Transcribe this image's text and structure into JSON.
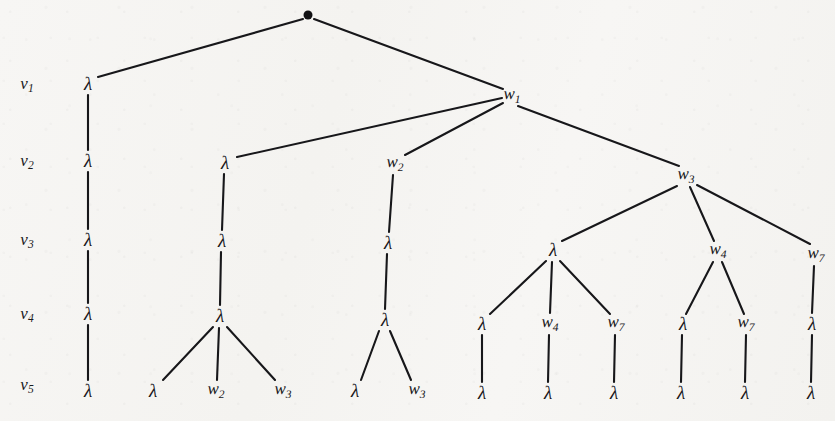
{
  "figure": {
    "kind": "labelled-tree-diagram",
    "width": 835,
    "height": 421,
    "background_color": "#f6f5f3",
    "ink_color": "#17171a"
  },
  "row_labels": [
    {
      "id": "row-v1",
      "text": "v",
      "sub": "1",
      "x": 27,
      "y": 84
    },
    {
      "id": "row-v2",
      "text": "v",
      "sub": "2",
      "x": 27,
      "y": 161
    },
    {
      "id": "row-v3",
      "text": "v",
      "sub": "3",
      "x": 27,
      "y": 240
    },
    {
      "id": "row-v4",
      "text": "v",
      "sub": "4",
      "x": 27,
      "y": 314
    },
    {
      "id": "row-v5",
      "text": "v",
      "sub": "5",
      "x": 27,
      "y": 385
    }
  ],
  "root": {
    "id": "root",
    "label": "●",
    "x": 308,
    "y": 15
  },
  "nodes": [
    {
      "id": "n-v1-lambda",
      "label": "λ",
      "sub": "",
      "x": 88,
      "y": 84,
      "row": "v1"
    },
    {
      "id": "n-v1-w1",
      "label": "w",
      "sub": "1",
      "x": 512,
      "y": 96,
      "row": "v1"
    },
    {
      "id": "n-v2-lambda-a",
      "label": "λ",
      "sub": "",
      "x": 88,
      "y": 161,
      "row": "v2"
    },
    {
      "id": "n-v2-lambda-b",
      "label": "λ",
      "sub": "",
      "x": 225,
      "y": 163,
      "row": "v2"
    },
    {
      "id": "n-v2-w2",
      "label": "w",
      "sub": "2",
      "x": 395,
      "y": 164,
      "row": "v2"
    },
    {
      "id": "n-v2-w3",
      "label": "w",
      "sub": "3",
      "x": 686,
      "y": 176,
      "row": "v2"
    },
    {
      "id": "n-v3-lambda-a",
      "label": "λ",
      "sub": "",
      "x": 88,
      "y": 240,
      "row": "v3"
    },
    {
      "id": "n-v3-lambda-b",
      "label": "λ",
      "sub": "",
      "x": 222,
      "y": 241,
      "row": "v3"
    },
    {
      "id": "n-v3-lambda-c",
      "label": "λ",
      "sub": "",
      "x": 388,
      "y": 243,
      "row": "v3"
    },
    {
      "id": "n-v3-lambda-d",
      "label": "λ",
      "sub": "",
      "x": 553,
      "y": 250,
      "row": "v3"
    },
    {
      "id": "n-v3-w4",
      "label": "w",
      "sub": "4",
      "x": 718,
      "y": 251,
      "row": "v3"
    },
    {
      "id": "n-v3-w7",
      "label": "w",
      "sub": "7",
      "x": 816,
      "y": 255,
      "row": "v3"
    },
    {
      "id": "n-v4-lambda-a",
      "label": "λ",
      "sub": "",
      "x": 88,
      "y": 314,
      "row": "v4"
    },
    {
      "id": "n-v4-lambda-b",
      "label": "λ",
      "sub": "",
      "x": 220,
      "y": 316,
      "row": "v4"
    },
    {
      "id": "n-v4-lambda-c",
      "label": "λ",
      "sub": "",
      "x": 385,
      "y": 320,
      "row": "v4"
    },
    {
      "id": "n-v4-lambda-d",
      "label": "λ",
      "sub": "",
      "x": 482,
      "y": 324,
      "row": "v4"
    },
    {
      "id": "n-v4-w4",
      "label": "w",
      "sub": "4",
      "x": 550,
      "y": 324,
      "row": "v4"
    },
    {
      "id": "n-v4-w7",
      "label": "w",
      "sub": "7",
      "x": 616,
      "y": 324,
      "row": "v4"
    },
    {
      "id": "n-v4-lambda-e",
      "label": "λ",
      "sub": "",
      "x": 683,
      "y": 324,
      "row": "v4"
    },
    {
      "id": "n-v4-w7-b",
      "label": "w",
      "sub": "7",
      "x": 746,
      "y": 324,
      "row": "v4"
    },
    {
      "id": "n-v4-lambda-f",
      "label": "λ",
      "sub": "",
      "x": 812,
      "y": 324,
      "row": "v4"
    },
    {
      "id": "n-v5-lambda-a",
      "label": "λ",
      "sub": "",
      "x": 88,
      "y": 391,
      "row": "v5"
    },
    {
      "id": "n-v5-lambda-b",
      "label": "λ",
      "sub": "",
      "x": 153,
      "y": 391,
      "row": "v5"
    },
    {
      "id": "n-v5-w2",
      "label": "w",
      "sub": "2",
      "x": 216,
      "y": 391,
      "row": "v5"
    },
    {
      "id": "n-v5-w3",
      "label": "w",
      "sub": "3",
      "x": 283,
      "y": 391,
      "row": "v5"
    },
    {
      "id": "n-v5-lambda-c",
      "label": "λ",
      "sub": "",
      "x": 355,
      "y": 391,
      "row": "v5"
    },
    {
      "id": "n-v5-w3-b",
      "label": "w",
      "sub": "3",
      "x": 417,
      "y": 391,
      "row": "v5"
    },
    {
      "id": "n-v5-lambda-d",
      "label": "λ",
      "sub": "",
      "x": 482,
      "y": 393,
      "row": "v5"
    },
    {
      "id": "n-v5-lambda-e",
      "label": "λ",
      "sub": "",
      "x": 548,
      "y": 393,
      "row": "v5"
    },
    {
      "id": "n-v5-lambda-f",
      "label": "λ",
      "sub": "",
      "x": 614,
      "y": 393,
      "row": "v5"
    },
    {
      "id": "n-v5-lambda-g",
      "label": "λ",
      "sub": "",
      "x": 681,
      "y": 393,
      "row": "v5"
    },
    {
      "id": "n-v5-lambda-h",
      "label": "λ",
      "sub": "",
      "x": 745,
      "y": 393,
      "row": "v5"
    },
    {
      "id": "n-v5-lambda-i",
      "label": "λ",
      "sub": "",
      "x": 811,
      "y": 393,
      "row": "v5"
    }
  ],
  "edges": [
    {
      "from": "root",
      "to": "n-v1-lambda",
      "x1": 303,
      "y1": 19,
      "x2": 98,
      "y2": 77
    },
    {
      "from": "root",
      "to": "n-v1-w1",
      "x1": 314,
      "y1": 19,
      "x2": 503,
      "y2": 89
    },
    {
      "from": "n-v1-lambda",
      "to": "n-v2-lambda-a",
      "x1": 88,
      "y1": 95,
      "x2": 88,
      "y2": 150
    },
    {
      "from": "n-v1-w1",
      "to": "n-v2-lambda-b",
      "x1": 502,
      "y1": 98,
      "x2": 237,
      "y2": 157
    },
    {
      "from": "n-v1-w1",
      "to": "n-v2-w2",
      "x1": 503,
      "y1": 103,
      "x2": 405,
      "y2": 155
    },
    {
      "from": "n-v1-w1",
      "to": "n-v2-w3",
      "x1": 518,
      "y1": 106,
      "x2": 679,
      "y2": 166
    },
    {
      "from": "n-v2-lambda-a",
      "to": "n-v3-lambda-a",
      "x1": 88,
      "y1": 172,
      "x2": 88,
      "y2": 229
    },
    {
      "from": "n-v2-lambda-b",
      "to": "n-v3-lambda-b",
      "x1": 224,
      "y1": 174,
      "x2": 222,
      "y2": 230
    },
    {
      "from": "n-v2-w2",
      "to": "n-v3-lambda-c",
      "x1": 393,
      "y1": 175,
      "x2": 389,
      "y2": 232
    },
    {
      "from": "n-v2-w3",
      "to": "n-v3-lambda-d",
      "x1": 677,
      "y1": 186,
      "x2": 562,
      "y2": 241
    },
    {
      "from": "n-v2-w3",
      "to": "n-v3-w4",
      "x1": 690,
      "y1": 187,
      "x2": 714,
      "y2": 241
    },
    {
      "from": "n-v2-w3",
      "to": "n-v3-w7",
      "x1": 697,
      "y1": 185,
      "x2": 810,
      "y2": 244
    },
    {
      "from": "n-v3-lambda-a",
      "to": "n-v4-lambda-a",
      "x1": 88,
      "y1": 251,
      "x2": 88,
      "y2": 303
    },
    {
      "from": "n-v3-lambda-b",
      "to": "n-v4-lambda-b",
      "x1": 221,
      "y1": 252,
      "x2": 220,
      "y2": 305
    },
    {
      "from": "n-v3-lambda-c",
      "to": "n-v4-lambda-c",
      "x1": 387,
      "y1": 254,
      "x2": 385,
      "y2": 309
    },
    {
      "from": "n-v3-lambda-d",
      "to": "n-v4-lambda-d",
      "x1": 546,
      "y1": 261,
      "x2": 490,
      "y2": 314
    },
    {
      "from": "n-v3-lambda-d",
      "to": "n-v4-w4",
      "x1": 552,
      "y1": 262,
      "x2": 550,
      "y2": 313
    },
    {
      "from": "n-v3-lambda-d",
      "to": "n-v4-w7",
      "x1": 560,
      "y1": 261,
      "x2": 610,
      "y2": 314
    },
    {
      "from": "n-v3-w4",
      "to": "n-v4-lambda-e",
      "x1": 713,
      "y1": 262,
      "x2": 686,
      "y2": 314
    },
    {
      "from": "n-v3-w4",
      "to": "n-v4-w7-b",
      "x1": 722,
      "y1": 262,
      "x2": 744,
      "y2": 314
    },
    {
      "from": "n-v3-w7",
      "to": "n-v4-lambda-f",
      "x1": 814,
      "y1": 266,
      "x2": 812,
      "y2": 313
    },
    {
      "from": "n-v4-lambda-a",
      "to": "n-v5-lambda-a",
      "x1": 88,
      "y1": 325,
      "x2": 88,
      "y2": 380
    },
    {
      "from": "n-v4-lambda-b",
      "to": "n-v5-lambda-b",
      "x1": 213,
      "y1": 327,
      "x2": 163,
      "y2": 380
    },
    {
      "from": "n-v4-lambda-b",
      "to": "n-v5-w2",
      "x1": 219,
      "y1": 328,
      "x2": 217,
      "y2": 380
    },
    {
      "from": "n-v4-lambda-b",
      "to": "n-v5-w3",
      "x1": 227,
      "y1": 327,
      "x2": 275,
      "y2": 380
    },
    {
      "from": "n-v4-lambda-c",
      "to": "n-v5-lambda-c",
      "x1": 379,
      "y1": 331,
      "x2": 361,
      "y2": 380
    },
    {
      "from": "n-v4-lambda-c",
      "to": "n-v5-w3-b",
      "x1": 390,
      "y1": 331,
      "x2": 411,
      "y2": 380
    },
    {
      "from": "n-v4-lambda-d",
      "to": "n-v5-lambda-d",
      "x1": 482,
      "y1": 335,
      "x2": 482,
      "y2": 382
    },
    {
      "from": "n-v4-w4",
      "to": "n-v5-lambda-e",
      "x1": 549,
      "y1": 335,
      "x2": 548,
      "y2": 382
    },
    {
      "from": "n-v4-w7",
      "to": "n-v5-lambda-f",
      "x1": 615,
      "y1": 335,
      "x2": 614,
      "y2": 382
    },
    {
      "from": "n-v4-lambda-e",
      "to": "n-v5-lambda-g",
      "x1": 682,
      "y1": 335,
      "x2": 681,
      "y2": 382
    },
    {
      "from": "n-v4-w7-b",
      "to": "n-v5-lambda-h",
      "x1": 746,
      "y1": 335,
      "x2": 745,
      "y2": 382
    },
    {
      "from": "n-v4-lambda-f",
      "to": "n-v5-lambda-i",
      "x1": 812,
      "y1": 335,
      "x2": 811,
      "y2": 382
    }
  ]
}
